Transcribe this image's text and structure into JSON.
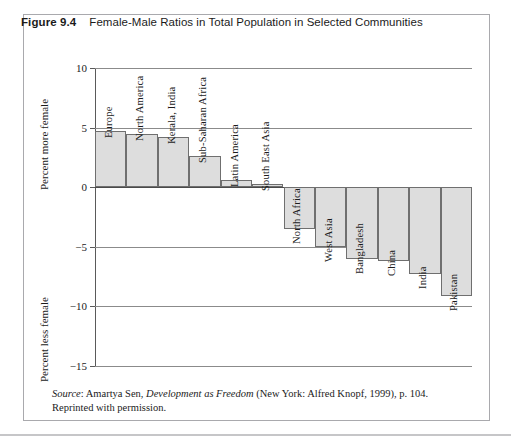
{
  "figure": {
    "number": "Figure 9.4",
    "title": "Female-Male Ratios in Total Population in Selected Communities"
  },
  "axis": {
    "upper_title": "Percent more female",
    "lower_title": "Percent less female",
    "tick_labels": [
      "10",
      "5",
      "0",
      "−5",
      "−10",
      "−15"
    ]
  },
  "source": {
    "label": "Source",
    "text_before": ": Amartya Sen, ",
    "italic_title": "Development as Freedom",
    "text_after": " (New York: Alfred Knopf, 1999), p. 104. Reprinted with permission."
  },
  "colors": {
    "bar_fill": "#dddddd",
    "bar_stroke": "#6f6f6f",
    "gridline": "#8b8b8b",
    "frame": "#a9a9ad",
    "text": "#1b1b1b"
  },
  "chart_data": {
    "type": "bar",
    "title": "Female-Male Ratios in Total Population in Selected Communities",
    "xlabel": "",
    "ylabel": "Percent more female / Percent less female",
    "ylim": [
      -15,
      10
    ],
    "yticks": [
      10,
      5,
      0,
      -5,
      -10,
      -15
    ],
    "grid": true,
    "legend": "none",
    "orientation": "vertical",
    "categories": [
      "Europe",
      "North America",
      "Kerala, India",
      "Sub-Saharan Africa",
      "Latin America",
      "South East Asia",
      "North Africa",
      "West Asia",
      "Bangladesh",
      "China",
      "India",
      "Pakistan"
    ],
    "values": [
      4.7,
      4.5,
      4.2,
      2.6,
      0.6,
      0.3,
      -3.5,
      -5.0,
      -6.0,
      -6.2,
      -7.3,
      -9.1
    ]
  }
}
